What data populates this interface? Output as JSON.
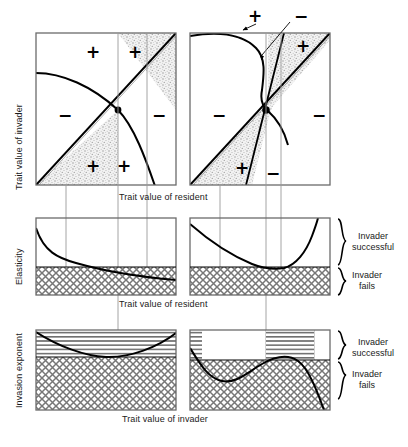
{
  "figure": {
    "kind": "pairwise-invasibility-plot-panel-figure",
    "panel_count": 6,
    "rows": 3,
    "columns": 2
  },
  "axes": {
    "top_y_label": "Trait value of invader",
    "top_x_label": "Trait value of resident",
    "middle_y_label": "Elasticity",
    "middle_x_label": "Trait value of resident",
    "bottom_y_label": "Invasion exponent",
    "bottom_x_label": "Trait value of invader"
  },
  "braces": {
    "upper_label_line1": "Invader",
    "upper_label_line2": "successful",
    "lower_label_line1": "Invader",
    "lower_label_line2": "fails"
  },
  "signs": {
    "plus": "+",
    "minus": "−"
  },
  "panels": {
    "top_left": {
      "name": "pip-left",
      "region_signs": [
        {
          "sign": "+",
          "x": 86,
          "y": 44
        },
        {
          "sign": "+",
          "x": 128,
          "y": 44
        },
        {
          "sign": "−",
          "x": 58,
          "y": 107
        },
        {
          "sign": "−",
          "x": 152,
          "y": 107
        },
        {
          "sign": "+",
          "x": 86,
          "y": 158
        },
        {
          "sign": "+",
          "x": 117,
          "y": 158
        }
      ]
    },
    "top_right": {
      "name": "pip-right",
      "region_signs": [
        {
          "sign": "+",
          "x": 248,
          "y": 8
        },
        {
          "sign": "−",
          "x": 294,
          "y": 8
        },
        {
          "sign": "+",
          "x": 296,
          "y": 38
        },
        {
          "sign": "−",
          "x": 212,
          "y": 107
        },
        {
          "sign": "−",
          "x": 312,
          "y": 107
        },
        {
          "sign": "+",
          "x": 235,
          "y": 160
        },
        {
          "sign": "−",
          "x": 266,
          "y": 165
        }
      ]
    },
    "middle_left": {
      "name": "elasticity-left",
      "curve": "monotone-decreasing"
    },
    "middle_right": {
      "name": "elasticity-right",
      "curve": "decreasing-then-upturn"
    },
    "bottom_left": {
      "name": "invasion-exponent-left",
      "curve": "shallow-u"
    },
    "bottom_right": {
      "name": "invasion-exponent-right",
      "curve": "wavy-down"
    }
  },
  "colors": {
    "stipple": "#cfcfcf",
    "hatch": "#808080",
    "line": "#000000",
    "frame": "#6b6b6b",
    "guide": "#9a9a9a",
    "text": "#1a1a1a"
  }
}
